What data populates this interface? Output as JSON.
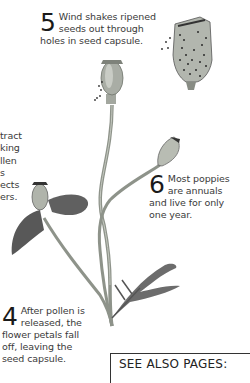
{
  "captions": {
    "step5": {
      "number": "5",
      "text": "Wind shakes ripened seeds out through holes in seed capsule."
    },
    "step6": {
      "number": "6",
      "text": "Most poppies are annuals and live for only one year."
    },
    "step4": {
      "number": "4",
      "text": "After pollen is released, the flower petals fall off, leaving the seed capsule."
    },
    "step3_partial": {
      "lines": [
        "tract",
        "king",
        "llen",
        "s",
        "ects",
        "ers."
      ]
    }
  },
  "see_also": {
    "label": "SEE ALSO PAGES:"
  },
  "illustrations": [
    {
      "name": "seed-capsule-cutaway",
      "description": "Cross-section of ripe poppy seed capsule with seeds"
    },
    {
      "name": "ripe-seed-capsule",
      "description": "Seed capsule on stem releasing seeds"
    },
    {
      "name": "young-seed-capsule",
      "description": "Green seed capsule on side stem"
    },
    {
      "name": "flower-losing-petals",
      "description": "Capsule with falling petals"
    },
    {
      "name": "poppy-leaf",
      "description": "Feathery lobed leaf"
    }
  ],
  "colors": {
    "text": "#3a3a3a",
    "stem": "#8a8f86",
    "petal": "#5e5e5e",
    "capsule": "#b8bdb4"
  }
}
